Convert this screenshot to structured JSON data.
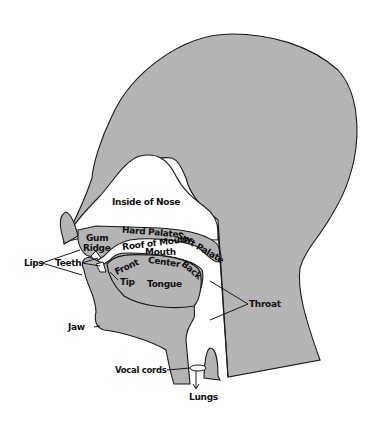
{
  "diagram": {
    "colors": {
      "fill": "#b4b4b4",
      "stroke": "#1a1a1a",
      "background": "#ffffff",
      "text": "#111111"
    },
    "labels": {
      "inside_nose": "Inside of Nose",
      "hard_palate": "Hard Palate",
      "soft_palate": "Soft Palate",
      "gum": "Gum",
      "ridge": "Ridge",
      "roof_of_mouth": "Roof of Mouth",
      "mouth": "Mouth",
      "lips": "Lips",
      "teeth": "Teeth",
      "front": "Front",
      "center": "Center",
      "back": "Back",
      "tip": "Tip",
      "tongue": "Tongue",
      "throat": "Throat",
      "jaw": "Jaw",
      "vocal_cords": "Vocal cords",
      "lungs": "Lungs"
    }
  }
}
